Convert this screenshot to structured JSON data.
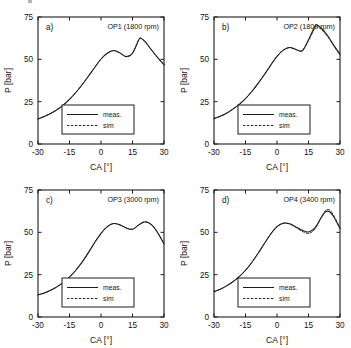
{
  "figure": {
    "panel_count": 4,
    "background_color": "#ffffff",
    "line_color": "#1d1d1d"
  },
  "chart_data": [
    {
      "type": "line",
      "panel_label": "a)",
      "title": "OP1 (1800 rpm)",
      "xlabel": "CA [°]",
      "ylabel": "P [bar]",
      "xlim": [
        -30,
        30
      ],
      "ylim": [
        0,
        75
      ],
      "xticks": [
        -30,
        -15,
        0,
        15,
        30
      ],
      "yticks": [
        0,
        25,
        50,
        75
      ],
      "xtick_labels": [
        "-30",
        "-15",
        "0",
        "15",
        "30"
      ],
      "ytick_labels": [
        "0",
        "25",
        "50",
        "75"
      ],
      "grid": false,
      "legend_position": "lower center",
      "series": [
        {
          "name": "meas.",
          "style": "solid",
          "x": [
            -30,
            -27,
            -24,
            -21,
            -18,
            -15,
            -12,
            -9,
            -6,
            -3,
            0,
            3,
            6,
            9,
            12,
            15,
            18,
            19,
            21,
            24,
            27,
            30
          ],
          "values": [
            14.8,
            16.2,
            18.0,
            20.2,
            23.0,
            26.4,
            30.4,
            35.0,
            40.0,
            45.2,
            50.2,
            53.6,
            55.2,
            53.8,
            51.6,
            53.6,
            61.6,
            62.4,
            60.4,
            55.6,
            51.0,
            46.8
          ]
        },
        {
          "name": "sim",
          "style": "dashed",
          "x": [
            -30,
            -27,
            -24,
            -21,
            -18,
            -15,
            -12,
            -9,
            -6,
            -3,
            0,
            3,
            6,
            9,
            12,
            15,
            18,
            19,
            21,
            24,
            27,
            30
          ],
          "values": [
            14.8,
            16.2,
            18.0,
            20.2,
            23.0,
            26.4,
            30.4,
            35.0,
            40.0,
            45.2,
            50.2,
            53.6,
            55.2,
            53.8,
            51.6,
            53.6,
            61.6,
            62.4,
            60.4,
            55.6,
            51.0,
            46.8
          ]
        }
      ]
    },
    {
      "type": "line",
      "panel_label": "b)",
      "title": "OP2 (1800 rpm)",
      "xlabel": "CA [°]",
      "ylabel": "P [bar]",
      "xlim": [
        -30,
        30
      ],
      "ylim": [
        0,
        75
      ],
      "xticks": [
        -30,
        -15,
        0,
        15,
        30
      ],
      "yticks": [
        0,
        25,
        50,
        75
      ],
      "xtick_labels": [
        "-30",
        "-15",
        "0",
        "15",
        "30"
      ],
      "ytick_labels": [
        "0",
        "25",
        "50",
        "75"
      ],
      "grid": false,
      "legend_position": "lower center",
      "series": [
        {
          "name": "meas.",
          "style": "solid",
          "x": [
            -30,
            -27,
            -24,
            -21,
            -18,
            -15,
            -12,
            -9,
            -6,
            -3,
            0,
            3,
            6,
            9,
            12,
            15,
            18,
            19,
            21,
            24,
            27,
            30
          ],
          "values": [
            15.0,
            16.4,
            18.2,
            20.6,
            23.4,
            26.8,
            31.0,
            35.8,
            41.0,
            46.6,
            51.8,
            55.4,
            57.0,
            55.8,
            55.0,
            61.6,
            69.4,
            70.2,
            68.6,
            64.2,
            58.4,
            53.0
          ]
        },
        {
          "name": "sim",
          "style": "dashed",
          "x": [
            -30,
            -27,
            -24,
            -21,
            -18,
            -15,
            -12,
            -9,
            -6,
            -3,
            0,
            3,
            6,
            9,
            12,
            15,
            18,
            19,
            21,
            24,
            27,
            30
          ],
          "values": [
            15.0,
            16.4,
            18.2,
            20.6,
            23.4,
            26.8,
            31.0,
            35.8,
            41.0,
            46.6,
            51.8,
            55.4,
            57.0,
            55.8,
            55.2,
            61.0,
            68.4,
            69.2,
            67.8,
            63.6,
            58.0,
            52.6
          ]
        }
      ]
    },
    {
      "type": "line",
      "panel_label": "c)",
      "title": "OP3 (3000 rpm)",
      "xlabel": "CA [°]",
      "ylabel": "P [bar]",
      "xlim": [
        -30,
        30
      ],
      "ylim": [
        0,
        75
      ],
      "xticks": [
        -30,
        -15,
        0,
        15,
        30
      ],
      "yticks": [
        0,
        25,
        50,
        75
      ],
      "xtick_labels": [
        "-30",
        "-15",
        "0",
        "15",
        "30"
      ],
      "ytick_labels": [
        "0",
        "25",
        "50",
        "75"
      ],
      "grid": false,
      "legend_position": "lower center",
      "series": [
        {
          "name": "meas.",
          "style": "solid",
          "x": [
            -30,
            -27,
            -24,
            -21,
            -18,
            -15,
            -12,
            -9,
            -6,
            -3,
            0,
            3,
            6,
            9,
            12,
            15,
            18,
            21,
            24,
            27,
            30
          ],
          "values": [
            13.0,
            14.2,
            15.8,
            17.8,
            20.4,
            23.6,
            27.6,
            32.4,
            38.0,
            44.0,
            49.4,
            53.4,
            55.2,
            54.4,
            52.6,
            51.8,
            54.4,
            56.2,
            54.6,
            49.8,
            43.2
          ]
        },
        {
          "name": "sim",
          "style": "dashed",
          "x": [
            -30,
            -27,
            -24,
            -21,
            -18,
            -15,
            -12,
            -9,
            -6,
            -3,
            0,
            3,
            6,
            9,
            12,
            15,
            18,
            21,
            24,
            27,
            30
          ],
          "values": [
            13.0,
            14.2,
            15.8,
            17.8,
            20.4,
            23.6,
            27.6,
            32.4,
            38.0,
            44.0,
            49.4,
            53.4,
            55.2,
            54.4,
            52.6,
            51.8,
            54.4,
            56.2,
            54.6,
            49.8,
            43.2
          ]
        }
      ]
    },
    {
      "type": "line",
      "panel_label": "d)",
      "title": "OP4 (3400 rpm)",
      "xlabel": "CA [°]",
      "ylabel": "P [bar]",
      "xlim": [
        -30,
        30
      ],
      "ylim": [
        0,
        75
      ],
      "xticks": [
        -30,
        -15,
        0,
        15,
        30
      ],
      "yticks": [
        0,
        25,
        50,
        75
      ],
      "xtick_labels": [
        "-30",
        "-15",
        "0",
        "15",
        "30"
      ],
      "ytick_labels": [
        "0",
        "25",
        "50",
        "75"
      ],
      "grid": false,
      "legend_position": "lower center",
      "series": [
        {
          "name": "meas.",
          "style": "solid",
          "x": [
            -30,
            -27,
            -24,
            -21,
            -18,
            -15,
            -12,
            -9,
            -6,
            -3,
            0,
            3,
            6,
            9,
            12,
            15,
            18,
            21,
            23,
            25,
            27,
            30
          ],
          "values": [
            15.0,
            16.4,
            18.4,
            20.8,
            23.8,
            27.6,
            32.2,
            37.6,
            43.4,
            49.0,
            53.4,
            55.4,
            55.0,
            53.2,
            51.2,
            50.2,
            52.6,
            58.6,
            62.0,
            62.2,
            59.2,
            52.2
          ]
        },
        {
          "name": "sim",
          "style": "dashed",
          "x": [
            -30,
            -27,
            -24,
            -21,
            -18,
            -15,
            -12,
            -9,
            -6,
            -3,
            0,
            3,
            6,
            9,
            12,
            15,
            18,
            21,
            23,
            25,
            27,
            30
          ],
          "values": [
            15.0,
            16.4,
            18.4,
            20.8,
            23.8,
            27.6,
            32.2,
            37.6,
            43.4,
            49.0,
            53.4,
            55.4,
            55.0,
            53.0,
            50.6,
            49.4,
            51.8,
            58.6,
            62.8,
            63.2,
            60.0,
            52.6
          ]
        }
      ]
    }
  ]
}
